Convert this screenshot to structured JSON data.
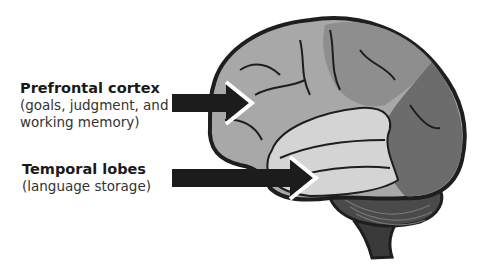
{
  "labels": [
    {
      "title": "Prefrontal cortex",
      "lines": [
        "(goals, judgment, and",
        "working memory)"
      ]
    },
    {
      "title": "Temporal lobes",
      "lines": [
        "(language storage)"
      ]
    }
  ],
  "colors": {
    "outline": "#1e1e1e",
    "frontal": "#a8a8a8",
    "parietal": "#9a9a9a",
    "occipital": "#6c6c6c",
    "temporal": "#d2d2d2",
    "cerebellum": "#4a4a4a",
    "arrow": "#1c1c1c"
  }
}
